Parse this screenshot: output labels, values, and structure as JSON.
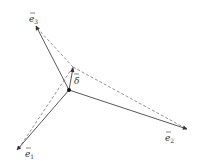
{
  "diagram": {
    "title": "",
    "origin": {
      "x": 69,
      "y": 90
    },
    "offset_point": {
      "x": 73,
      "y": 67
    },
    "colors": {
      "solid": "#444444",
      "dashed": "#777777",
      "point": "#111111",
      "text": "#333333"
    },
    "vectors": [
      {
        "id": "e1",
        "label": "e",
        "subscript": "1",
        "tip": {
          "x": 17,
          "y": 150
        },
        "label_pos": {
          "x": 26,
          "y": 157
        }
      },
      {
        "id": "e2",
        "label": "e",
        "subscript": "2",
        "tip": {
          "x": 187,
          "y": 129
        },
        "label_pos": {
          "x": 165,
          "y": 140
        }
      },
      {
        "id": "e3",
        "label": "e",
        "subscript": "3",
        "tip": {
          "x": 36,
          "y": 26
        },
        "label_pos": {
          "x": 29,
          "y": 22
        }
      },
      {
        "id": "delta",
        "label": "δ",
        "subscript": "",
        "tip": {
          "x": 73,
          "y": 68
        },
        "label_pos": {
          "x": 74,
          "y": 84
        }
      }
    ],
    "dashed_edges": [
      {
        "from": "offset_point",
        "to": "e1"
      },
      {
        "from": "offset_point",
        "to": "e2"
      },
      {
        "from": "offset_point",
        "to": "e3"
      }
    ]
  }
}
